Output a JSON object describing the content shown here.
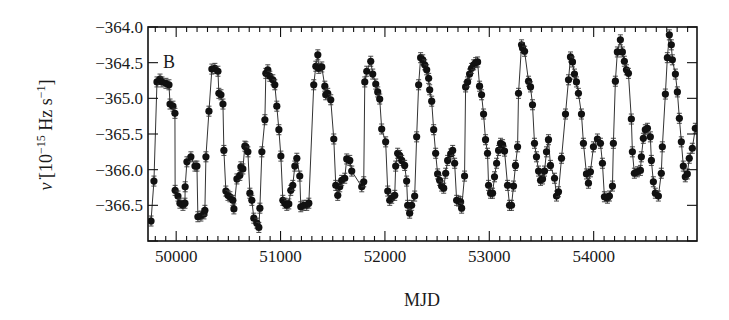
{
  "chart_data": {
    "type": "scatter",
    "title": "",
    "panel_label": "B",
    "xlabel": "MJD",
    "ylabel": "ν̇ [10⁻¹⁵ Hz s⁻¹]",
    "ylabel_parts": {
      "symbol": "ν̇",
      "open": " [10",
      "exp1": "−15",
      "mid": " Hz s",
      "exp2": "−1",
      "close": "]"
    },
    "xlim": [
      49730,
      54990
    ],
    "ylim": [
      -367.0,
      -364.0
    ],
    "xticks": [
      50000,
      51000,
      52000,
      53000,
      54000
    ],
    "xtick_labels": [
      "50000",
      "51000",
      "52000",
      "53000",
      "54000"
    ],
    "x_minor_step": 100,
    "yticks": [
      -364.0,
      -364.5,
      -365.0,
      -365.5,
      -366.0,
      -366.5
    ],
    "ytick_labels": [
      "−364.0",
      "−364.5",
      "−365.0",
      "−365.5",
      "−366.0",
      "−366.5"
    ],
    "y_minor_step": 0.1,
    "grid": false,
    "legend": null,
    "marker": "filled-circle",
    "connected": true,
    "error_bars": true,
    "colors": {
      "marker": "#111111",
      "line": "#333333",
      "axis": "#111111",
      "background": "#ffffff"
    },
    "series": [
      {
        "name": "spin-down rate",
        "x": [
          49759,
          49787,
          49816,
          49845,
          49864,
          49902,
          49931,
          49941,
          49969,
          49988,
          49990,
          50017,
          50036,
          50065,
          50084,
          50086,
          50103,
          50141,
          50180,
          50199,
          50208,
          50237,
          50266,
          50275,
          50285,
          50314,
          50342,
          50371,
          50400,
          50409,
          50429,
          50448,
          50457,
          50476,
          50496,
          50515,
          50543,
          50553,
          50582,
          50610,
          50620,
          50639,
          50658,
          50668,
          50687,
          50706,
          50725,
          50744,
          50773,
          50792,
          50802,
          50821,
          50850,
          50859,
          50878,
          50897,
          50926,
          50945,
          50964,
          50984,
          51003,
          51022,
          51041,
          51060,
          51079,
          51098,
          51117,
          51137,
          51156,
          51184,
          51194,
          51223,
          51251,
          51271,
          51318,
          51338,
          51357,
          51366,
          51395,
          51424,
          51433,
          51452,
          51481,
          51510,
          51529,
          51548,
          51567,
          51586,
          51615,
          51634,
          51663,
          51682,
          51778,
          51797,
          51807,
          51826,
          51864,
          51883,
          51912,
          51931,
          51950,
          51969,
          52007,
          52027,
          52046,
          52065,
          52094,
          52103,
          52122,
          52141,
          52161,
          52189,
          52208,
          52218,
          52237,
          52256,
          52285,
          52304,
          52323,
          52342,
          52362,
          52381,
          52400,
          52419,
          52429,
          52448,
          52467,
          52486,
          52505,
          52524,
          52543,
          52563,
          52582,
          52601,
          52630,
          52649,
          52668,
          52687,
          52706,
          52725,
          52735,
          52763,
          52773,
          52792,
          52811,
          52830,
          52850,
          52869,
          52888,
          52907,
          52926,
          52945,
          52964,
          52983,
          52993,
          53012,
          53031,
          53050,
          53070,
          53089,
          53108,
          53127,
          53146,
          53175,
          53194,
          53213,
          53232,
          53251,
          53271,
          53280,
          53309,
          53318,
          53338,
          53376,
          53395,
          53414,
          53433,
          53452,
          53472,
          53491,
          53510,
          53529,
          53548,
          53567,
          53586,
          53625,
          53644,
          53663,
          53692,
          53730,
          53759,
          53778,
          53797,
          53816,
          53835,
          53854,
          53883,
          53902,
          53931,
          53950,
          53969,
          53998,
          54036,
          54065,
          54084,
          54103,
          54132,
          54151,
          54180,
          54189,
          54208,
          54227,
          54256,
          54275,
          54294,
          54314,
          54333,
          54361,
          54371,
          54390,
          54419,
          54448,
          54457,
          54476,
          54495,
          54515,
          54543,
          54553,
          54572,
          54591,
          54620,
          54648,
          54658,
          54687,
          54706,
          54725,
          54744,
          54754,
          54783,
          54802,
          54821,
          54840,
          54859,
          54878,
          54897,
          54916,
          54945,
          54974
        ],
        "values": [
          -366.72,
          -366.16,
          -364.77,
          -364.73,
          -364.77,
          -364.79,
          -364.81,
          -365.08,
          -365.11,
          -365.21,
          -366.29,
          -366.37,
          -366.47,
          -366.5,
          -366.47,
          -366.24,
          -365.89,
          -365.82,
          -365.95,
          -365.95,
          -366.66,
          -366.65,
          -366.62,
          -366.57,
          -365.82,
          -365.18,
          -364.59,
          -364.58,
          -364.62,
          -364.93,
          -364.95,
          -365.08,
          -365.73,
          -366.3,
          -366.36,
          -366.38,
          -366.43,
          -366.55,
          -366.13,
          -366.08,
          -365.96,
          -365.99,
          -365.67,
          -365.68,
          -365.75,
          -366.33,
          -366.43,
          -366.68,
          -366.75,
          -366.81,
          -366.54,
          -365.75,
          -365.3,
          -364.65,
          -364.6,
          -364.69,
          -364.74,
          -364.81,
          -365.11,
          -365.44,
          -365.81,
          -366.43,
          -366.47,
          -366.5,
          -366.48,
          -366.29,
          -366.22,
          -365.95,
          -365.84,
          -366.09,
          -366.52,
          -366.5,
          -366.5,
          -366.47,
          -364.81,
          -364.55,
          -364.39,
          -364.58,
          -364.56,
          -364.83,
          -364.95,
          -364.93,
          -365.02,
          -365.57,
          -366.22,
          -366.36,
          -366.24,
          -366.15,
          -366.12,
          -365.85,
          -365.87,
          -366.02,
          -366.24,
          -366.17,
          -364.77,
          -364.62,
          -364.48,
          -364.66,
          -364.8,
          -364.91,
          -365.01,
          -365.43,
          -365.61,
          -366.3,
          -366.43,
          -366.4,
          -366.36,
          -365.95,
          -365.77,
          -365.8,
          -365.87,
          -365.94,
          -366.16,
          -366.5,
          -366.61,
          -366.5,
          -366.37,
          -365.54,
          -364.81,
          -364.43,
          -364.46,
          -364.53,
          -364.6,
          -364.72,
          -364.88,
          -365.04,
          -365.44,
          -365.77,
          -366.06,
          -366.15,
          -366.23,
          -366.26,
          -366.05,
          -365.87,
          -365.78,
          -365.73,
          -365.91,
          -366.43,
          -366.44,
          -366.45,
          -366.54,
          -366.09,
          -364.84,
          -364.77,
          -364.66,
          -364.58,
          -364.53,
          -364.5,
          -364.49,
          -364.83,
          -364.95,
          -365.22,
          -365.58,
          -365.77,
          -366.22,
          -366.33,
          -366.33,
          -366.1,
          -365.91,
          -365.73,
          -365.63,
          -365.65,
          -365.74,
          -366.22,
          -366.5,
          -366.5,
          -366.23,
          -365.94,
          -365.68,
          -364.93,
          -364.25,
          -364.29,
          -364.34,
          -364.76,
          -364.84,
          -365.09,
          -365.63,
          -365.82,
          -366.02,
          -366.15,
          -366.13,
          -366.02,
          -365.75,
          -365.58,
          -365.94,
          -366.12,
          -366.37,
          -366.31,
          -365.84,
          -365.22,
          -364.74,
          -364.42,
          -364.49,
          -364.66,
          -364.77,
          -364.93,
          -365.22,
          -365.63,
          -366.06,
          -366.19,
          -366.03,
          -365.68,
          -365.57,
          -365.63,
          -365.91,
          -366.38,
          -366.4,
          -366.37,
          -366.23,
          -365.63,
          -364.76,
          -364.35,
          -364.18,
          -364.35,
          -364.48,
          -364.6,
          -364.65,
          -365.29,
          -365.75,
          -366.05,
          -366.03,
          -366.01,
          -365.82,
          -365.56,
          -365.44,
          -365.42,
          -365.54,
          -365.87,
          -366.17,
          -366.33,
          -366.37,
          -366.05,
          -365.68,
          -364.94,
          -364.43,
          -364.11,
          -364.25,
          -364.46,
          -364.66,
          -364.91,
          -365.28,
          -365.61,
          -365.95,
          -366.1,
          -366.06,
          -365.84,
          -365.7,
          -365.42
        ]
      }
    ]
  }
}
